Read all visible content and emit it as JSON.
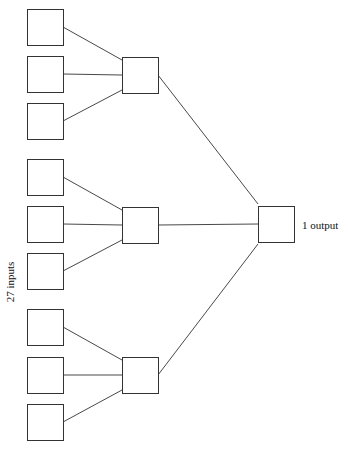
{
  "diagram": {
    "type": "neural-network",
    "input_label": "27 inputs",
    "output_label": "1 output",
    "layers": [
      {
        "name": "input",
        "count": 9
      },
      {
        "name": "hidden",
        "count": 3
      },
      {
        "name": "output",
        "count": 1
      }
    ],
    "connections": {
      "input_to_hidden": "each hidden unit connects to 3 input units",
      "hidden_to_output": "fully connected"
    },
    "colors": {
      "stroke": "#333333",
      "fill": "#ffffff"
    }
  }
}
